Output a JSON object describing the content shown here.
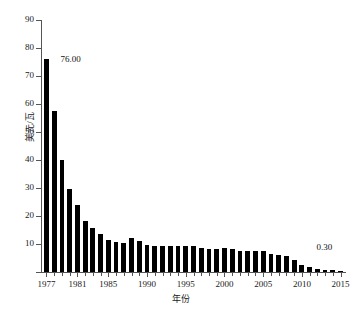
{
  "chart_data": {
    "type": "bar",
    "title": "",
    "subtitle": "",
    "xlabel": "年份",
    "ylabel": "美元/瓦",
    "xlim": [
      1976.3,
      2015.7
    ],
    "ylim": [
      0,
      90
    ],
    "grid": false,
    "legend": null,
    "bar_color": "#000000",
    "axis_color": "#555555",
    "y_ticks": [
      0,
      10,
      20,
      30,
      40,
      50,
      60,
      70,
      80,
      90
    ],
    "y_tick_labels": [
      "",
      "10",
      "20",
      "30",
      "40",
      "50",
      "60",
      "70",
      "80",
      "90"
    ],
    "x_ticks": [
      1977,
      1978,
      1979,
      1980,
      1981,
      1982,
      1983,
      1984,
      1985,
      1986,
      1987,
      1988,
      1989,
      1990,
      1991,
      1992,
      1993,
      1994,
      1995,
      1996,
      1997,
      1998,
      1999,
      2000,
      2001,
      2002,
      2003,
      2004,
      2005,
      2006,
      2007,
      2008,
      2009,
      2010,
      2011,
      2012,
      2013,
      2014,
      2015
    ],
    "x_tick_labels_major": [
      "1977",
      "1981",
      "1985",
      "1990",
      "1995",
      "2000",
      "2005",
      "2010",
      "2015"
    ],
    "x_major_years": [
      1977,
      1981,
      1985,
      1990,
      1995,
      2000,
      2005,
      2010,
      2015
    ],
    "categories": [
      1977,
      1978,
      1979,
      1980,
      1981,
      1982,
      1983,
      1984,
      1985,
      1986,
      1987,
      1988,
      1989,
      1990,
      1991,
      1992,
      1993,
      1994,
      1995,
      1996,
      1997,
      1998,
      1999,
      2000,
      2001,
      2002,
      2003,
      2004,
      2005,
      2006,
      2007,
      2008,
      2009,
      2010,
      2011,
      2012,
      2013,
      2014,
      2015
    ],
    "values": [
      76.0,
      57.5,
      40.0,
      29.8,
      24.0,
      18.2,
      15.8,
      13.6,
      11.5,
      10.8,
      10.4,
      12.3,
      11.2,
      9.6,
      9.4,
      9.3,
      9.3,
      9.3,
      9.3,
      9.2,
      8.5,
      8.1,
      8.3,
      8.4,
      8.2,
      7.6,
      7.5,
      7.4,
      7.5,
      6.3,
      6.0,
      5.8,
      4.2,
      2.5,
      1.7,
      1.1,
      0.85,
      0.6,
      0.3
    ],
    "annotations": [
      {
        "text": "76.00",
        "year": 1977,
        "value": 76.0
      },
      {
        "text": "0.30",
        "year": 2015,
        "value": 0.3
      }
    ]
  },
  "axes": {
    "x_title": "年份",
    "y_title": "美元/瓦"
  }
}
